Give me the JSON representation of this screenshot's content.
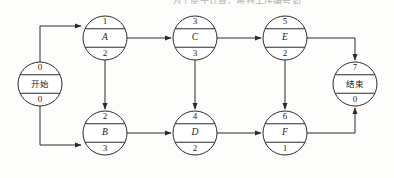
{
  "page": {
    "top_text": "为了便于计算，将各工序编号如下图。",
    "background_color": "#fdfdfc",
    "line_color": "#2b2b2b"
  },
  "diagram": {
    "type": "activity-on-node-network",
    "nodes": [
      {
        "id": "start",
        "top": "0",
        "label": "开始",
        "bottom": "0",
        "cx": 40,
        "cy": 84,
        "r": 22,
        "script": "cjk"
      },
      {
        "id": "a",
        "top": "1",
        "label": "A",
        "bottom": "2",
        "cx": 105,
        "cy": 38,
        "r": 22,
        "script": "latin"
      },
      {
        "id": "c",
        "top": "3",
        "label": "C",
        "bottom": "3",
        "cx": 195,
        "cy": 38,
        "r": 22,
        "script": "latin"
      },
      {
        "id": "e",
        "top": "5",
        "label": "E",
        "bottom": "2",
        "cx": 285,
        "cy": 38,
        "r": 22,
        "script": "latin"
      },
      {
        "id": "b",
        "top": "2",
        "label": "B",
        "bottom": "3",
        "cx": 105,
        "cy": 133,
        "r": 22,
        "script": "latin"
      },
      {
        "id": "d",
        "top": "4",
        "label": "D",
        "bottom": "2",
        "cx": 195,
        "cy": 133,
        "r": 22,
        "script": "latin"
      },
      {
        "id": "f",
        "top": "6",
        "label": "F",
        "bottom": "1",
        "cx": 285,
        "cy": 133,
        "r": 22,
        "script": "latin"
      },
      {
        "id": "end",
        "top": "7",
        "label": "结束",
        "bottom": "0",
        "cx": 355,
        "cy": 84,
        "r": 22,
        "script": "cjk"
      }
    ],
    "edges": [
      {
        "from": "start",
        "to": "a",
        "path": "M 40,62 L 40,26 L 81,26",
        "arrow": "right"
      },
      {
        "from": "start",
        "to": "b",
        "path": "M 40,106 L 40,145 L 81,145",
        "arrow": "right"
      },
      {
        "from": "a",
        "to": "c",
        "path": "M 127,38 L 171,38",
        "arrow": "right"
      },
      {
        "from": "c",
        "to": "e",
        "path": "M 217,38 L 261,38",
        "arrow": "right"
      },
      {
        "from": "a",
        "to": "b",
        "path": "M 105,60 L 105,109",
        "arrow": "down"
      },
      {
        "from": "c",
        "to": "d",
        "path": "M 195,60 L 195,109",
        "arrow": "down"
      },
      {
        "from": "e",
        "to": "f",
        "path": "M 285,60 L 285,109",
        "arrow": "down"
      },
      {
        "from": "b",
        "to": "d",
        "path": "M 127,133 L 171,133",
        "arrow": "right"
      },
      {
        "from": "d",
        "to": "f",
        "path": "M 217,133 L 261,133",
        "arrow": "right"
      },
      {
        "from": "e",
        "to": "end",
        "path": "M 307,38 L 355,38 L 355,60",
        "arrow": "down"
      },
      {
        "from": "f",
        "to": "end",
        "path": "M 307,133 L 355,133 L 355,108",
        "arrow": "up"
      }
    ]
  }
}
